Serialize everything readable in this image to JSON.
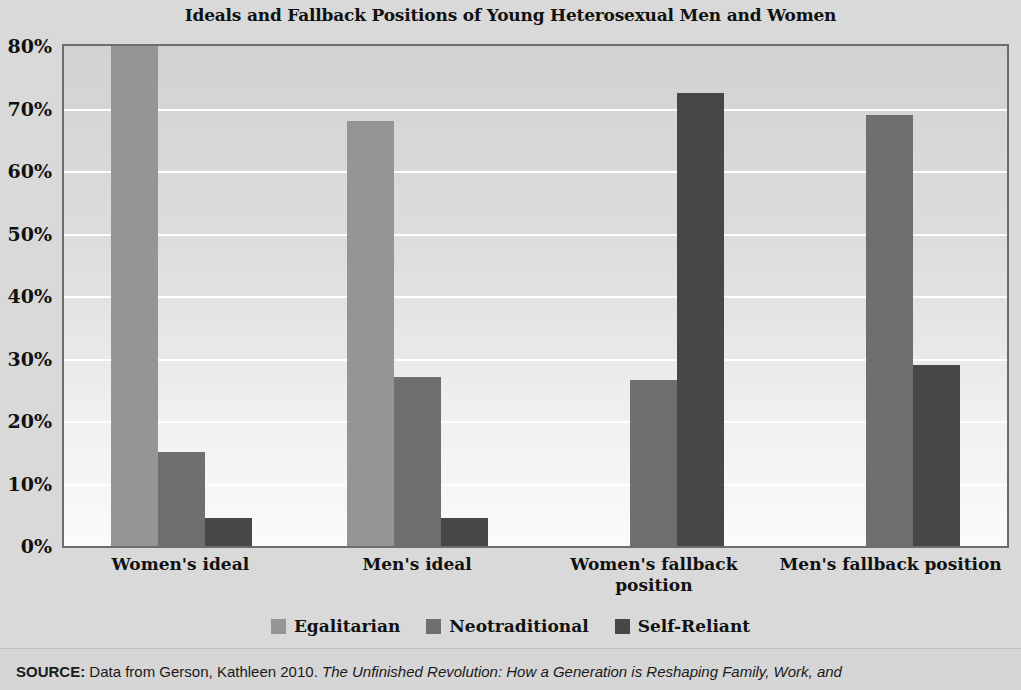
{
  "chart_data": {
    "type": "bar",
    "title": "Ideals and Fallback Positions of Young Heterosexual Men and Women",
    "xlabel": "",
    "ylabel": "",
    "ylim": [
      0,
      80
    ],
    "grid": true,
    "legend_position": "bottom",
    "categories": [
      "Women's ideal",
      "Men's ideal",
      "Women's fallback position",
      "Men's fallback position"
    ],
    "series": [
      {
        "name": "Egalitarian",
        "color": "#959595",
        "values": [
          80,
          68,
          0,
          0
        ]
      },
      {
        "name": "Neotraditional",
        "color": "#6f6f6f",
        "values": [
          15,
          27,
          26.5,
          69
        ]
      },
      {
        "name": "Self-Reliant",
        "color": "#474747",
        "values": [
          4.5,
          4.5,
          72.5,
          29
        ]
      }
    ],
    "yticks": [
      "0%",
      "10%",
      "20%",
      "30%",
      "40%",
      "50%",
      "60%",
      "70%",
      "80%"
    ],
    "ytick_values": [
      0,
      10,
      20,
      30,
      40,
      50,
      60,
      70,
      80
    ]
  },
  "source": {
    "keyword": "SOURCE:",
    "prefix": " Data from Gerson, Kathleen 2010. ",
    "italic_title": "The Unfinished Revolution: How a Generation is Reshaping Family, Work, and"
  }
}
